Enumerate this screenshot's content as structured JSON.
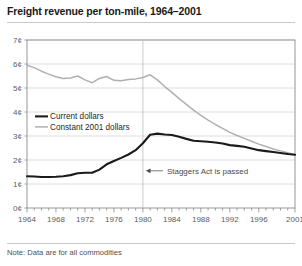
{
  "title": "Freight revenue per ton-mile, 1964–2001",
  "note": "Note: Data are for all commodities",
  "legend": {
    "current_label": "Current dollars",
    "constant_label": "Constant 2001 dollars"
  },
  "annotation": {
    "staggers_label": "Staggers Act is passed"
  },
  "axis": {
    "y_ticks": [
      "0¢",
      "1¢",
      "2¢",
      "3¢",
      "4¢",
      "5¢",
      "6¢",
      "7¢"
    ],
    "x_ticks": [
      "1964",
      "1968",
      "1972",
      "1976",
      "1980",
      "1984",
      "1988",
      "1992",
      "1996",
      "2001"
    ]
  },
  "colors": {
    "current_line": "#1a1a1a",
    "constant_line": "#b0b0b0",
    "grid": "#d6d6d6",
    "axis": "#8c8c8c",
    "text": "#5d5d5d",
    "background": "#ffffff"
  },
  "chart_data": {
    "type": "line",
    "title": "Freight revenue per ton-mile, 1964–2001",
    "xlabel": "",
    "ylabel": "Revenue per ton-mile (cents)",
    "xlim": [
      1964,
      2001
    ],
    "ylim": [
      0,
      7
    ],
    "y_tick_values": [
      0,
      1,
      2,
      3,
      4,
      5,
      6,
      7
    ],
    "y_tick_labels": [
      "0¢",
      "1¢",
      "2¢",
      "3¢",
      "4¢",
      "5¢",
      "6¢",
      "7¢"
    ],
    "x_tick_values": [
      1964,
      1968,
      1972,
      1976,
      1980,
      1984,
      1988,
      1992,
      1996,
      2001
    ],
    "x_tick_labels": [
      "1964",
      "1968",
      "1972",
      "1976",
      "1980",
      "1984",
      "1988",
      "1992",
      "1996",
      "2001"
    ],
    "x_minor_ticks": "every year",
    "grid": "horizontal",
    "legend_position": "inside-left-middle",
    "annotations": [
      {
        "text": "Staggers Act is passed",
        "x": 1980,
        "y": 1.55,
        "arrow": "left",
        "vertical_line_at_x": 1980
      }
    ],
    "x": [
      1964,
      1965,
      1966,
      1967,
      1968,
      1969,
      1970,
      1971,
      1972,
      1973,
      1974,
      1975,
      1976,
      1977,
      1978,
      1979,
      1980,
      1981,
      1982,
      1983,
      1984,
      1985,
      1986,
      1987,
      1988,
      1989,
      1990,
      1991,
      1992,
      1993,
      1994,
      1995,
      1996,
      1997,
      1998,
      1999,
      2000,
      2001
    ],
    "series": [
      {
        "name": "Current dollars",
        "color": "#1a1a1a",
        "values": [
          1.32,
          1.31,
          1.29,
          1.29,
          1.3,
          1.32,
          1.37,
          1.45,
          1.47,
          1.47,
          1.6,
          1.82,
          1.96,
          2.09,
          2.23,
          2.41,
          2.7,
          3.05,
          3.1,
          3.06,
          3.04,
          2.97,
          2.88,
          2.8,
          2.78,
          2.76,
          2.73,
          2.69,
          2.62,
          2.59,
          2.55,
          2.48,
          2.41,
          2.37,
          2.33,
          2.29,
          2.25,
          2.22
        ]
      },
      {
        "name": "Constant 2001 dollars",
        "color": "#b0b0b0",
        "values": [
          5.95,
          5.85,
          5.7,
          5.58,
          5.47,
          5.4,
          5.42,
          5.5,
          5.34,
          5.22,
          5.4,
          5.48,
          5.32,
          5.3,
          5.35,
          5.38,
          5.44,
          5.55,
          5.34,
          5.06,
          4.82,
          4.56,
          4.32,
          4.08,
          3.86,
          3.66,
          3.48,
          3.32,
          3.15,
          3.02,
          2.9,
          2.78,
          2.66,
          2.56,
          2.46,
          2.38,
          2.3,
          2.22
        ]
      }
    ]
  }
}
